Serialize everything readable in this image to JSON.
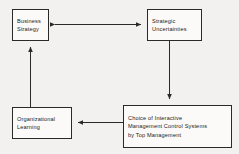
{
  "diagram": {
    "background_color": "#f2f1ef",
    "line_color": "#2a2a2a",
    "box_fill_color": "#fbfaf8",
    "nodes": [
      {
        "id": "business-strategy",
        "lines": [
          "Business",
          "Strategy"
        ]
      },
      {
        "id": "strategic-uncertainties",
        "lines": [
          "Strategic",
          "Uncertainties"
        ]
      },
      {
        "id": "organizational-learning",
        "lines": [
          "Organizational",
          "Learning"
        ]
      },
      {
        "id": "choice-of-interactive",
        "lines": [
          "Choice of Interactive",
          "Management Control Systems",
          "by Top Management"
        ]
      }
    ],
    "connectors": [
      {
        "id": "business-strategy-to-strategic-uncertainties",
        "from": "business-strategy",
        "to": "strategic-uncertainties",
        "direction": "bidirectional",
        "orientation": "horizontal"
      },
      {
        "id": "strategic-uncertainties-to-choice",
        "from": "strategic-uncertainties",
        "to": "choice-of-interactive",
        "direction": "down",
        "orientation": "vertical"
      },
      {
        "id": "choice-to-organizational-learning",
        "from": "choice-of-interactive",
        "to": "organizational-learning",
        "direction": "left",
        "orientation": "horizontal"
      },
      {
        "id": "organizational-learning-to-business-strategy",
        "from": "organizational-learning",
        "to": "business-strategy",
        "direction": "up",
        "orientation": "vertical"
      }
    ]
  }
}
